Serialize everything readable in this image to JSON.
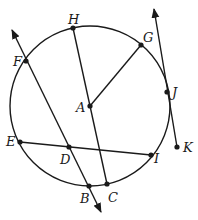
{
  "diagram": {
    "type": "circle-geometry",
    "circle": {
      "center": "A",
      "cx": 90,
      "cy": 106,
      "r": 80
    },
    "points": [
      {
        "name": "A",
        "x": 90,
        "y": 106,
        "lx": 76,
        "ly": 112
      },
      {
        "name": "B",
        "x": 89,
        "y": 186,
        "lx": 80,
        "ly": 203
      },
      {
        "name": "C",
        "x": 107,
        "y": 184,
        "lx": 108,
        "ly": 202
      },
      {
        "name": "D",
        "x": 69,
        "y": 147,
        "lx": 60,
        "ly": 164
      },
      {
        "name": "E",
        "x": 20,
        "y": 142,
        "lx": 6,
        "ly": 146
      },
      {
        "name": "F",
        "x": 26,
        "y": 61,
        "lx": 13,
        "ly": 66
      },
      {
        "name": "G",
        "x": 141,
        "y": 45,
        "lx": 143,
        "ly": 42
      },
      {
        "name": "H",
        "x": 73,
        "y": 28,
        "lx": 68,
        "ly": 24
      },
      {
        "name": "I",
        "x": 151,
        "y": 155,
        "lx": 154,
        "ly": 163
      },
      {
        "name": "J",
        "x": 167,
        "y": 92,
        "lx": 172,
        "ly": 97
      },
      {
        "name": "K",
        "x": 177,
        "y": 147,
        "lx": 183,
        "ly": 152
      }
    ],
    "segments": [
      {
        "name": "segment-AG",
        "from": "A",
        "to": "G"
      },
      {
        "name": "segment-HC",
        "from": "H",
        "to": "C"
      },
      {
        "name": "segment-EI",
        "from": "E",
        "to": "I"
      }
    ],
    "rays_lines": [
      {
        "name": "line-FB",
        "through": [
          "F",
          "D",
          "B"
        ],
        "x1": 12,
        "y1": 30,
        "x2": 101,
        "y2": 212,
        "arrows": "both"
      },
      {
        "name": "ray-KJ",
        "through": [
          "K",
          "J"
        ],
        "x1": 177,
        "y1": 147,
        "x2": 154,
        "y2": 9,
        "arrows": "end"
      }
    ]
  }
}
